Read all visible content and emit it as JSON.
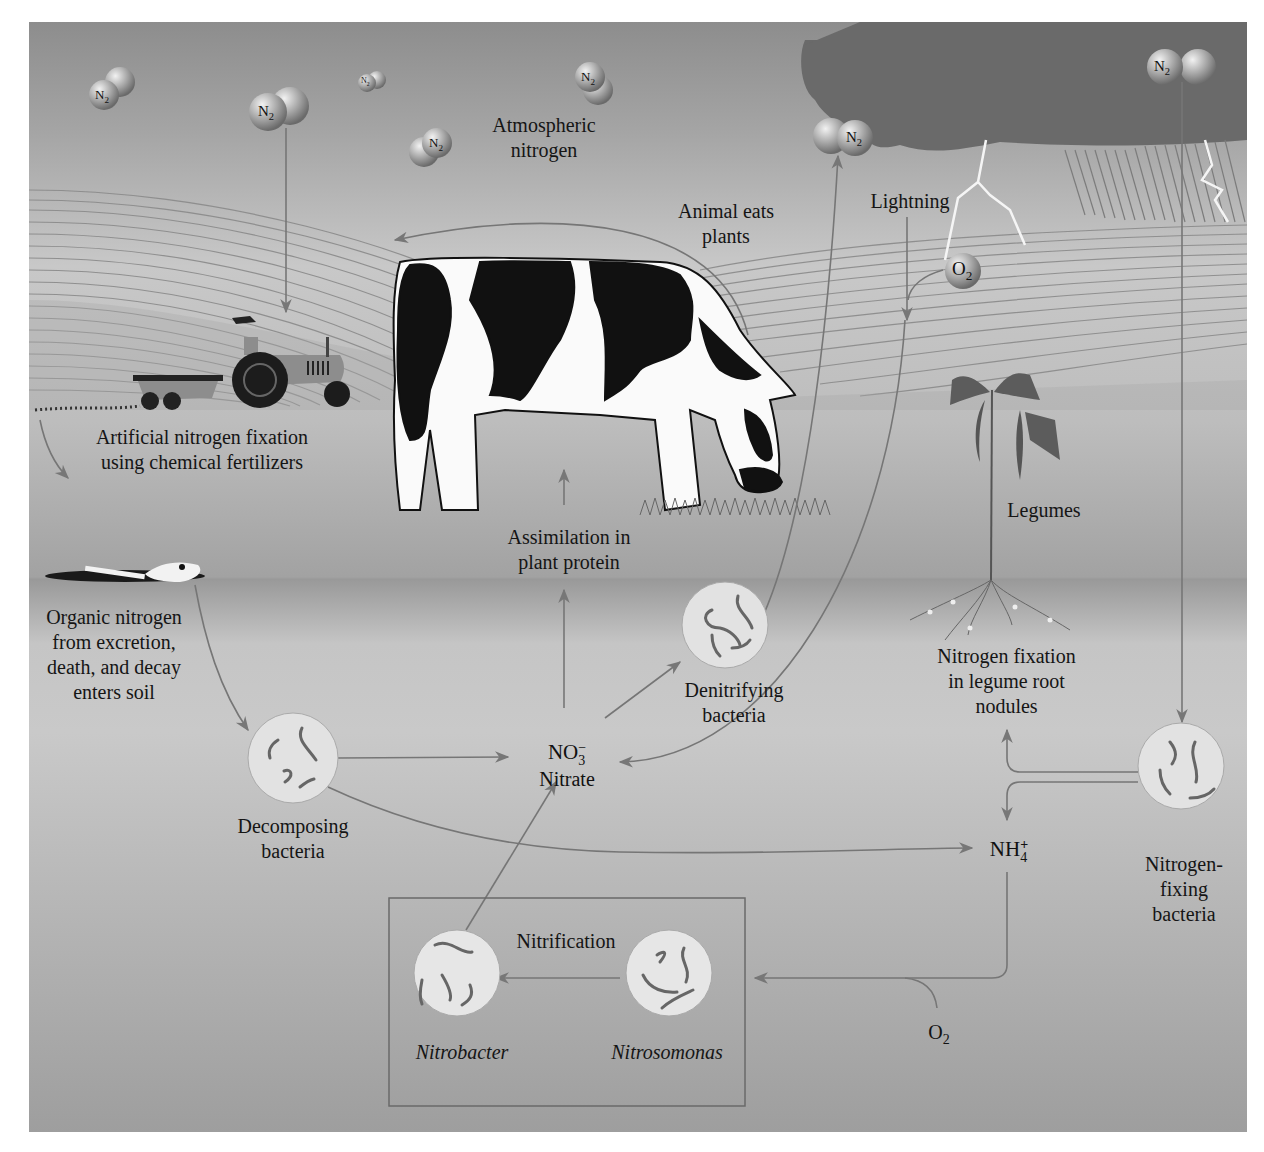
{
  "diagram": {
    "labels": {
      "atmospheric_nitrogen": [
        "Atmospheric",
        "nitrogen"
      ],
      "animal_eats_plants": [
        "Animal eats",
        "plants"
      ],
      "lightning": "Lightning",
      "artificial_fixation": [
        "Artificial nitrogen fixation",
        "using chemical fertilizers"
      ],
      "assimilation": [
        "Assimilation in",
        "plant protein"
      ],
      "legumes": "Legumes",
      "organic_nitrogen": [
        "Organic nitrogen",
        "from excretion,",
        "death, and decay",
        "enters soil"
      ],
      "denitrifying_bacteria": [
        "Denitrifying",
        "bacteria"
      ],
      "nitrogen_fixation_nodules": [
        "Nitrogen fixation",
        "in legume root",
        "nodules"
      ],
      "decomposing_bacteria": [
        "Decomposing",
        "bacteria"
      ],
      "nitrate_formula": "NO",
      "nitrate_formula_sub": "3",
      "nitrate_formula_sup": "−",
      "nitrate_name": "Nitrate",
      "ammonium_formula": "NH",
      "ammonium_formula_sub": "4",
      "ammonium_formula_sup": "+",
      "nitrogen_fixing_bacteria": [
        "Nitrogen-",
        "fixing",
        "bacteria"
      ],
      "nitrification": "Nitrification",
      "nitrobacter": "Nitrobacter",
      "nitrosomonas": "Nitrosomonas",
      "oxygen": "O",
      "oxygen_sub": "2"
    },
    "molecules": [
      {
        "label": "N",
        "sub": "2",
        "x": 105,
        "y": 95
      },
      {
        "label": "N",
        "sub": "2",
        "x": 268,
        "y": 112
      },
      {
        "label": "N",
        "sub": "2",
        "x": 367,
        "y": 82
      },
      {
        "label": "N",
        "sub": "2",
        "x": 590,
        "y": 77
      },
      {
        "label": "N",
        "sub": "2",
        "x": 437,
        "y": 143
      },
      {
        "label": "N",
        "sub": "2",
        "x": 855,
        "y": 138
      },
      {
        "label": "N",
        "sub": "2",
        "x": 1163,
        "y": 67
      },
      {
        "label": "O",
        "sub": "2",
        "x": 963,
        "y": 271
      }
    ],
    "flows": [
      {
        "from": "Atmospheric nitrogen",
        "to": "Artificial nitrogen fixation"
      },
      {
        "from": "Artificial nitrogen fixation",
        "to": "Soil"
      },
      {
        "from": "Organic nitrogen",
        "to": "Decomposing bacteria"
      },
      {
        "from": "Decomposing bacteria",
        "to": "Nitrate"
      },
      {
        "from": "Decomposing bacteria",
        "to": "NH4+"
      },
      {
        "from": "Nitrate",
        "to": "Assimilation in plant protein"
      },
      {
        "from": "Nitrate",
        "to": "Denitrifying bacteria"
      },
      {
        "from": "Denitrifying bacteria",
        "to": "Atmospheric nitrogen"
      },
      {
        "from": "Lightning",
        "to": "Nitrate"
      },
      {
        "from": "Animal eats plants",
        "to": "Organic nitrogen"
      },
      {
        "from": "Atmospheric nitrogen",
        "to": "Nitrogen-fixing bacteria"
      },
      {
        "from": "Nitrogen-fixing bacteria",
        "to": "Nitrogen fixation in legume root nodules"
      },
      {
        "from": "Nitrogen-fixing bacteria",
        "to": "NH4+"
      },
      {
        "from": "NH4+",
        "to": "Nitrosomonas"
      },
      {
        "from": "Nitrosomonas",
        "to": "Nitrobacter"
      },
      {
        "from": "Nitrobacter",
        "to": "Nitrate"
      }
    ],
    "colors": {
      "sky": "#a0a0a0",
      "cloud": "#6e6e6e",
      "soil": "#c4c4c4",
      "arrow": "#7a7a7a",
      "bacteria_circle": "#e4e4e4",
      "text": "#151515"
    }
  }
}
